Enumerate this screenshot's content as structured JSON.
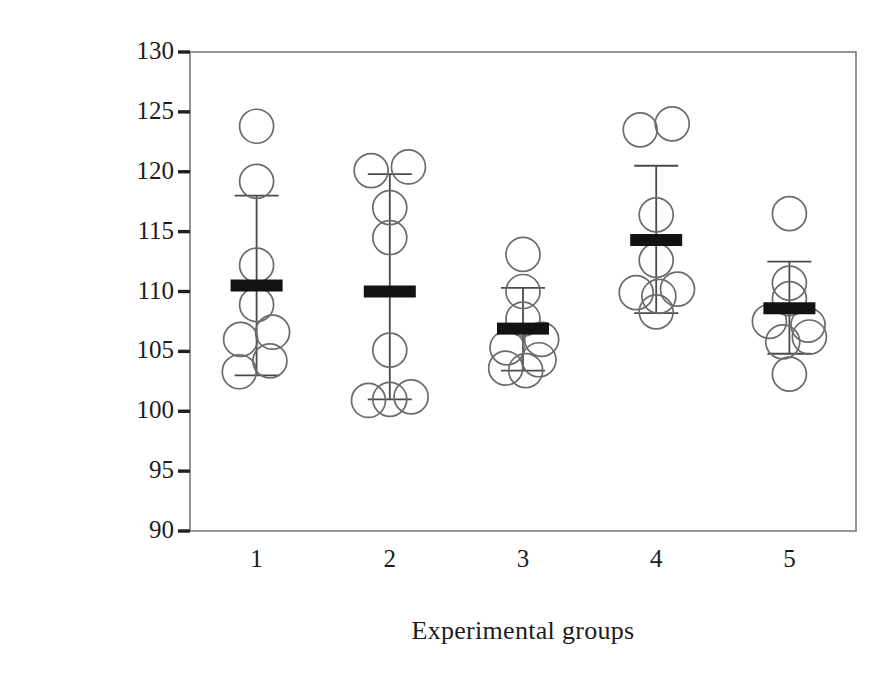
{
  "chart_data": {
    "type": "scatter",
    "title": "",
    "xlabel": "Experimental groups",
    "ylabel": "Incubation time, days",
    "grid": false,
    "legend": null,
    "xlim": [
      0.5,
      5.5
    ],
    "ylim": [
      90,
      130
    ],
    "yticks": [
      130,
      125,
      120,
      115,
      110,
      105,
      100,
      95,
      90
    ],
    "ytick_labels": [
      "130",
      "125",
      "120",
      "115",
      "110",
      "105",
      "100",
      "95",
      "90"
    ],
    "categories": [
      "1",
      "2",
      "3",
      "4",
      "5"
    ],
    "xtick_labels": [
      "1",
      "2",
      "3",
      "4",
      "5"
    ],
    "marker": "open-circle",
    "mean_marker": "thick-horizontal-bar",
    "error_bar": "whisker-with-caps",
    "series": [
      {
        "name": "Group 1",
        "x": 1,
        "mean": 110.5,
        "error_low": 103.0,
        "error_high": 118.0,
        "points": [
          123.8,
          119.2,
          112.2,
          108.9,
          106.6,
          106.0,
          104.2,
          103.3
        ],
        "point_offsets": [
          0,
          0,
          0,
          0,
          0.12,
          -0.12,
          0.1,
          -0.13
        ]
      },
      {
        "name": "Group 2",
        "x": 2,
        "mean": 110.0,
        "error_low": 101.0,
        "error_high": 119.8,
        "points": [
          120.4,
          120.1,
          117.0,
          114.5,
          105.1,
          101.2,
          101.0,
          100.9
        ],
        "point_offsets": [
          0.14,
          -0.14,
          0,
          0,
          0,
          0.16,
          0,
          -0.16
        ]
      },
      {
        "name": "Group 3",
        "x": 3,
        "mean": 106.9,
        "error_low": 103.4,
        "error_high": 110.3,
        "points": [
          113.1,
          110.0,
          107.7,
          106.0,
          105.3,
          104.3,
          103.6,
          103.4
        ],
        "point_offsets": [
          0,
          0,
          0,
          0.14,
          -0.12,
          0.12,
          -0.13,
          0.02
        ]
      },
      {
        "name": "Group 4",
        "x": 4,
        "mean": 114.3,
        "error_low": 108.2,
        "error_high": 120.5,
        "points": [
          124.0,
          123.5,
          116.4,
          112.6,
          110.2,
          109.9,
          109.6,
          108.3
        ],
        "point_offsets": [
          0.12,
          -0.12,
          0,
          0,
          0.16,
          -0.15,
          0.02,
          0
        ]
      },
      {
        "name": "Group 5",
        "x": 5,
        "mean": 108.6,
        "error_low": 104.8,
        "error_high": 112.5,
        "points": [
          116.5,
          110.7,
          109.4,
          107.5,
          107.2,
          106.2,
          105.8,
          103.1
        ],
        "point_offsets": [
          0,
          0,
          0,
          -0.15,
          0.14,
          0.15,
          -0.05,
          0
        ]
      }
    ]
  },
  "axis": {
    "frame_color": "#7b7b7b",
    "marker_color": "#6b6b6b",
    "mean_color": "#121212",
    "error_color": "#4a4a4a"
  }
}
